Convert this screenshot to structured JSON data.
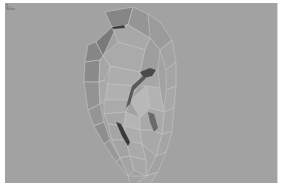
{
  "viewport": {
    "type": "3d-perspective-view",
    "background_color": "#a2a2a2",
    "model": {
      "name": "ear-mesh",
      "shading": "flat-shaded-polygons",
      "wireframe_color": "#c8c8c8"
    },
    "axis_gizmo": {
      "icon": "axis-icon",
      "position": "bottom-left"
    }
  }
}
